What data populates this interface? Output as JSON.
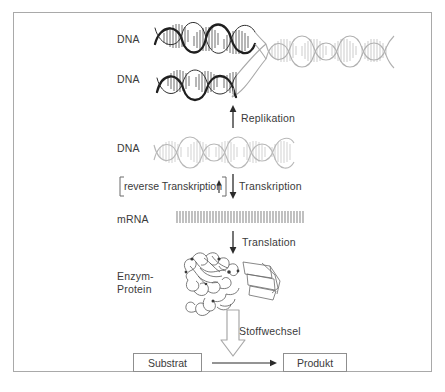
{
  "figure": {
    "title_alt": "Zentrales Dogma der Molekularbiologie",
    "background": "#ffffff",
    "frame_color": "#a9a9a9"
  },
  "labels": {
    "dna_top": "DNA",
    "dna_second": "DNA",
    "dna_third": "DNA",
    "mrna": "mRNA",
    "enzyme_line1": "Enzym-",
    "enzyme_line2": "Protein"
  },
  "processes": {
    "replikation": "Replikation",
    "reverse_transkription": "reverse Transkription",
    "transkription": "Transkription",
    "translation": "Translation",
    "stoffwechsel": "Stoffwechsel"
  },
  "reaction": {
    "substrate": "Substrat",
    "product": "Produkt"
  },
  "colors": {
    "dark_strand": "#2b2b2b",
    "light_strand": "#b4b4b4",
    "mid_strand": "#8d8d8d",
    "text": "#3a3a3a",
    "box_border": "#8f8f8f",
    "arrow_dark": "#2b2b2b",
    "arrow_light": "#a8a8a8"
  }
}
